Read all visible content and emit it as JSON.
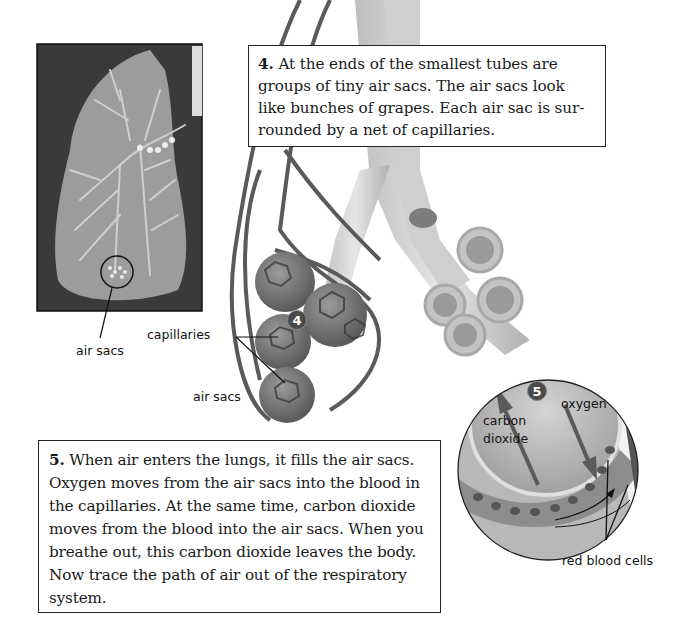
{
  "boxes": {
    "step4": {
      "number": "4.",
      "text": " At the ends of the smallest tubes are groups of tiny air sacs. The air sacs look like bunches of grapes. Each air sac is sur-rounded by a net of capillaries."
    },
    "step5": {
      "number": "5.",
      "text": " When air enters the lungs, it fills the air sacs. Oxygen moves from the air sacs into the blood in the capillaries. At the same time, carbon dioxide moves from the blood into the air sacs. When you breathe out, this carbon dioxide leaves the body. Now trace the path of air out of the respiratory system."
    }
  },
  "labels": {
    "lung_air_sacs": "air sacs",
    "capillaries": "capillaries",
    "air_sacs": "air sacs",
    "carbon": "carbon",
    "dioxide": "dioxide",
    "oxygen": "oxygen",
    "red_blood_cells": "red blood cells"
  },
  "badges": {
    "step4": "4",
    "step5": "5"
  }
}
